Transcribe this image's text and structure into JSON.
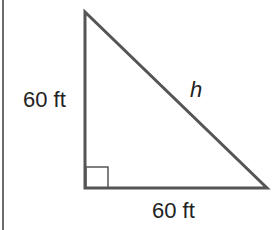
{
  "figure": {
    "type": "right-triangle",
    "labels": {
      "vertical_leg": "60 ft",
      "horizontal_leg": "60 ft",
      "hypotenuse": "h"
    },
    "right_angle_marker": true,
    "stroke_color": "#555555"
  }
}
